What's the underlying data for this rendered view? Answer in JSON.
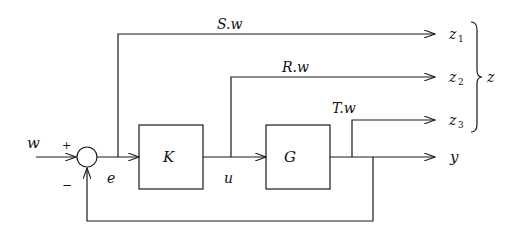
{
  "diagram": {
    "type": "block-diagram",
    "blocks": [
      {
        "id": "K",
        "label": "K"
      },
      {
        "id": "G",
        "label": "G"
      }
    ],
    "summing_junction": {
      "plus_label": "+",
      "minus_label": "−"
    },
    "signals": {
      "input": "w",
      "error": "e",
      "control": "u",
      "output": "y"
    },
    "branches": [
      {
        "id": "S",
        "label": "S.w",
        "output": "z",
        "subscript": "1"
      },
      {
        "id": "R",
        "label": "R.w",
        "output": "z",
        "subscript": "2"
      },
      {
        "id": "T",
        "label": "T.w",
        "output": "z",
        "subscript": "3"
      }
    ],
    "brace_label": "z"
  }
}
